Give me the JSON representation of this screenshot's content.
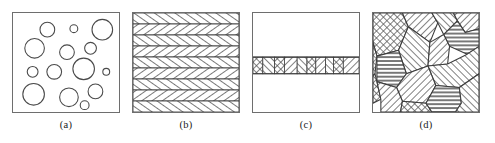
{
  "figure": {
    "background_color": "#ffffff",
    "frame_color": "#6e6e6e",
    "line_color": "#4a4a4a",
    "hatch_color": "#555555",
    "panel_count": 4,
    "panel_width": 108,
    "panel_height": 101
  },
  "panels": [
    {
      "id": "a",
      "caption": "(a)",
      "name": "dispersed-spherical-particles",
      "description": "Matrix containing randomly dispersed spherical particles of varying diameter",
      "circles": [
        {
          "cx": 35,
          "cy": 17,
          "r": 7.5
        },
        {
          "cx": 62,
          "cy": 16,
          "r": 4.0
        },
        {
          "cx": 91,
          "cy": 17,
          "r": 10.5
        },
        {
          "cx": 22,
          "cy": 36,
          "r": 10.0
        },
        {
          "cx": 55,
          "cy": 40,
          "r": 7.5
        },
        {
          "cx": 79,
          "cy": 36,
          "r": 6.0
        },
        {
          "cx": 20,
          "cy": 60,
          "r": 5.5
        },
        {
          "cx": 42,
          "cy": 60,
          "r": 7.5
        },
        {
          "cx": 72,
          "cy": 57,
          "r": 11.0
        },
        {
          "cx": 95,
          "cy": 60,
          "r": 3.5
        },
        {
          "cx": 21,
          "cy": 83,
          "r": 11.0
        },
        {
          "cx": 57,
          "cy": 86,
          "r": 9.5
        },
        {
          "cx": 84,
          "cy": 80,
          "r": 7.5
        },
        {
          "cx": 73,
          "cy": 94,
          "r": 4.5
        }
      ]
    },
    {
      "id": "b",
      "caption": "(b)",
      "name": "layered-laminar-structure",
      "description": "Stack of parallel horizontal lamellae with alternating hatch orientation",
      "band_count": 9,
      "band_orientations": [
        "left",
        "right",
        "left",
        "right",
        "left",
        "right",
        "left",
        "right",
        "left"
      ]
    },
    {
      "id": "c",
      "caption": "(c)",
      "name": "thin-interlayer-film",
      "description": "Two coarse regions separated by a thin hatched interlayer band of fine segments",
      "band_top": 45,
      "band_height": 17,
      "segments": [
        {
          "start": 0,
          "end": 10,
          "pattern": "cross"
        },
        {
          "start": 10,
          "end": 22,
          "pattern": "left"
        },
        {
          "start": 22,
          "end": 32,
          "pattern": "cross"
        },
        {
          "start": 32,
          "end": 45,
          "pattern": "right"
        },
        {
          "start": 45,
          "end": 55,
          "pattern": "left"
        },
        {
          "start": 55,
          "end": 64,
          "pattern": "cross"
        },
        {
          "start": 64,
          "end": 74,
          "pattern": "right"
        },
        {
          "start": 74,
          "end": 82,
          "pattern": "left"
        },
        {
          "start": 82,
          "end": 92,
          "pattern": "cross"
        },
        {
          "start": 92,
          "end": 108,
          "pattern": "right"
        }
      ]
    },
    {
      "id": "d",
      "caption": "(d)",
      "name": "polycrystalline-grain-structure",
      "description": "Space-filling polygonal grains each with its own hatch orientation",
      "grains": [
        {
          "points": "0,0 30,0 36,14 26,38 4,44 0,30",
          "pattern": "cross"
        },
        {
          "points": "30,0 60,0 66,10 58,30 36,14",
          "pattern": "right"
        },
        {
          "points": "60,0 82,0 86,8 72,22 66,10",
          "pattern": "left"
        },
        {
          "points": "82,0 108,0 108,16 94,20 86,8",
          "pattern": "right"
        },
        {
          "points": "86,8 94,20 108,16 108,34 96,42 78,34 72,22",
          "pattern": "dense-h"
        },
        {
          "points": "36,14 58,30 56,54 34,62 26,38",
          "pattern": "left"
        },
        {
          "points": "58,30 72,22 78,34 76,52 56,54",
          "pattern": "right"
        },
        {
          "points": "0,30 4,44 2,62 0,64",
          "pattern": "cross"
        },
        {
          "points": "4,44 26,38 34,62 24,76 4,70",
          "pattern": "dense-h"
        },
        {
          "points": "0,64 2,62 4,70 8,88 0,92",
          "pattern": "cross"
        },
        {
          "points": "56,54 76,52 96,42 108,34 108,62 88,76 64,74",
          "pattern": "left"
        },
        {
          "points": "34,62 56,54 64,74 54,92 30,90 24,76",
          "pattern": "right"
        },
        {
          "points": "4,70 24,76 30,90 28,101 8,101 8,88",
          "pattern": "right"
        },
        {
          "points": "30,90 54,92 60,101 28,101",
          "pattern": "cross"
        },
        {
          "points": "54,92 64,74 88,76 90,92 84,101 60,101",
          "pattern": "dense-h"
        },
        {
          "points": "88,76 108,62 108,101 84,101 90,92",
          "pattern": "left"
        }
      ]
    }
  ]
}
